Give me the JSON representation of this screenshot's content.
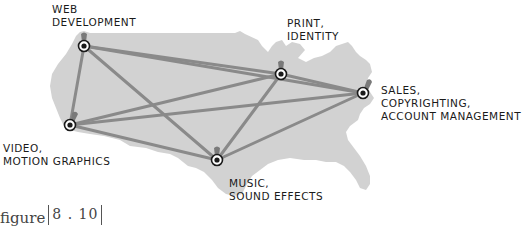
{
  "colors": {
    "map_fill": "#d2d2d2",
    "edge": "#8a8a8a",
    "node_ring": "#1a1a1a",
    "pin": "#7a7a7a",
    "text": "#1a1a1a"
  },
  "nodes": [
    {
      "id": "web",
      "lines": [
        "WEB",
        "DEVELOPMENT"
      ],
      "x": 84,
      "y": 46
    },
    {
      "id": "print",
      "lines": [
        "PRINT,",
        "IDENTITY"
      ],
      "x": 281,
      "y": 74
    },
    {
      "id": "sales",
      "lines": [
        "SALES,",
        "COPYRIGHTING,",
        "ACCOUNT MANAGEMENT"
      ],
      "x": 363,
      "y": 93
    },
    {
      "id": "video",
      "lines": [
        "VIDEO,",
        "MOTION GRAPHICS"
      ],
      "x": 70,
      "y": 125
    },
    {
      "id": "music",
      "lines": [
        "MUSIC,",
        "SOUND EFFECTS"
      ],
      "x": 217,
      "y": 160
    }
  ],
  "caption": {
    "word": "figure",
    "number": "8 . 10"
  }
}
